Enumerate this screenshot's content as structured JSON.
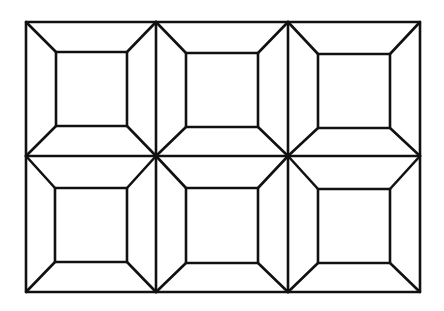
{
  "diagram": {
    "title": "",
    "stroke_color": "#111111",
    "background": "#ffffff",
    "outer": {
      "x1": 26,
      "y1": 22,
      "x2": 420,
      "y2": 292
    },
    "grid": {
      "cols": 3,
      "rows": 2,
      "col_x": [
        26,
        156,
        288,
        420
      ],
      "row_y": [
        22,
        156,
        292
      ]
    },
    "tiles": [
      {
        "row": 0,
        "col": 0,
        "inner": {
          "x1": 56,
          "y1": 52,
          "x2": 127,
          "y2": 126
        }
      },
      {
        "row": 0,
        "col": 1,
        "inner": {
          "x1": 186,
          "y1": 53,
          "x2": 258,
          "y2": 127
        }
      },
      {
        "row": 0,
        "col": 2,
        "inner": {
          "x1": 318,
          "y1": 54,
          "x2": 390,
          "y2": 128
        }
      },
      {
        "row": 1,
        "col": 0,
        "inner": {
          "x1": 55,
          "y1": 188,
          "x2": 127,
          "y2": 262
        }
      },
      {
        "row": 1,
        "col": 1,
        "inner": {
          "x1": 186,
          "y1": 188,
          "x2": 258,
          "y2": 263
        }
      },
      {
        "row": 1,
        "col": 2,
        "inner": {
          "x1": 318,
          "y1": 189,
          "x2": 390,
          "y2": 263
        }
      }
    ]
  }
}
